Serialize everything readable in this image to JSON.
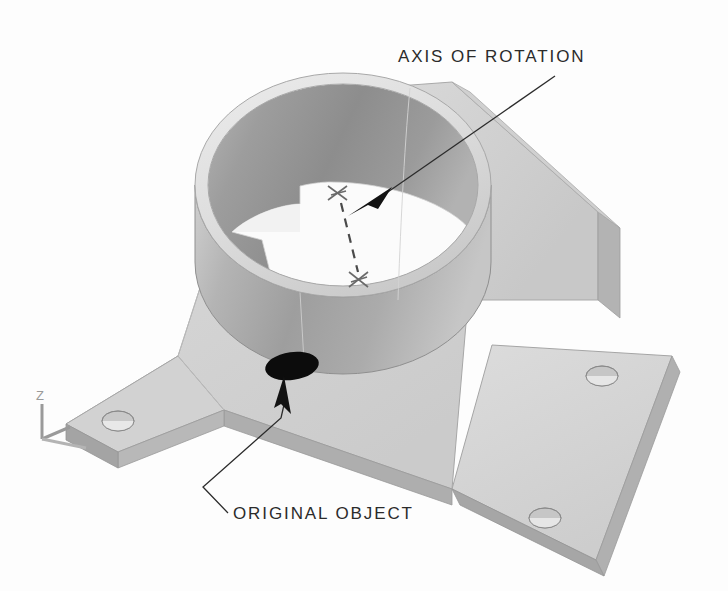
{
  "image": {
    "title": "Rotated cylinder boss on flanged mounting base",
    "background_color": "#fdfdfd",
    "width": 728,
    "height": 591
  },
  "annotations": {
    "axis_of_rotation": {
      "label": "AXIS OF ROTATION",
      "text_x": 398,
      "text_y": 62,
      "leader_color": "#2b2b2b"
    },
    "original_object": {
      "label": "ORIGINAL OBJECT",
      "text_x": 233,
      "text_y": 518,
      "leader_color": "#2b2b2b"
    }
  },
  "axis_indicator": {
    "z_label": "Z",
    "x_label": "",
    "color": "#9a9a9a"
  },
  "axis_markers": {
    "upper": {
      "x": 337,
      "y": 193,
      "symbol": "x-marker"
    },
    "lower": {
      "x": 358,
      "y": 280,
      "symbol": "x-marker"
    },
    "dash_color": "#4a4a4a"
  },
  "colors": {
    "background": "#fdfdfd",
    "rim_light": "#e2e2e2",
    "rim_edge": "#cfcfcf",
    "inner_wall_dark": "#9a9a9a",
    "inner_wall_darker": "#8c8c8c",
    "cylinder_front": "#a8a8a8",
    "cylinder_front_light": "#c2c2c2",
    "floor_white": "#fbfbfb",
    "base_top": "#d4d4d4",
    "base_side": "#b6b6b6",
    "base_edge": "#9f9f9f",
    "flange_top": "#d8d8d8",
    "flange_side": "#aeaeae",
    "web_light": "#dcdcdc",
    "web_mid": "#c6c6c6",
    "hole_black": "#0c0c0c",
    "hole_gray": "#b0b0b0",
    "outline": "#8f8f8f",
    "annotation": "#2b2b2b"
  },
  "geometry": {
    "cylinder": {
      "top_ellipse_cx": 343,
      "top_ellipse_cy": 185,
      "top_ellipse_rx": 148,
      "top_ellipse_ry": 112,
      "wall_thickness": 13,
      "height": 175
    },
    "holes": [
      {
        "name": "original-object-hole",
        "cx": 292,
        "cy": 366,
        "rx": 26,
        "ry": 13,
        "fill": "#0c0c0c"
      },
      {
        "name": "base-left-hole",
        "cx": 118,
        "cy": 421,
        "rx": 15,
        "ry": 9,
        "fill": "#c9c9c9"
      },
      {
        "name": "flange-upper-right-hole",
        "cx": 602,
        "cy": 376,
        "rx": 15,
        "ry": 9,
        "fill": "#c9c9c9"
      },
      {
        "name": "flange-lower-right-hole",
        "cx": 545,
        "cy": 518,
        "rx": 15,
        "ry": 9,
        "fill": "#c9c9c9"
      }
    ]
  }
}
